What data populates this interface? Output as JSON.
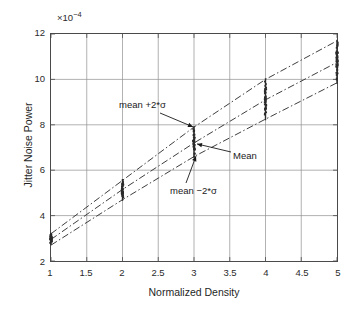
{
  "chart_data": {
    "type": "scatter",
    "title": "",
    "subtitle": "",
    "xlabel": "Normalized Density",
    "ylabel": "Jitter Noise Power",
    "y_exponent_prefix": "×10",
    "y_exponent_power": "−4",
    "y_exponent_full": "×10⁻⁴",
    "xlim": [
      1,
      5
    ],
    "ylim": [
      2,
      12
    ],
    "xticks": [
      "1",
      "1.5",
      "2",
      "2.5",
      "3",
      "3.5",
      "4",
      "4.5",
      "5"
    ],
    "xtick_values": [
      1,
      1.5,
      2,
      2.5,
      3,
      3.5,
      4,
      4.5,
      5
    ],
    "yticks": [
      "2",
      "4",
      "6",
      "8",
      "10",
      "12"
    ],
    "ytick_values": [
      2,
      4,
      6,
      8,
      10,
      12
    ],
    "grid": true,
    "legend": "none",
    "line_style": "dash-dot",
    "series": [
      {
        "name": "mean +2*σ",
        "style": "dash-dot",
        "color": "#3c3c3c",
        "x": [
          1,
          2,
          3,
          4,
          5
        ],
        "values": [
          3.2,
          5.55,
          7.9,
          10.0,
          11.7
        ]
      },
      {
        "name": "Mean",
        "style": "dash-dot",
        "color": "#3c3c3c",
        "x": [
          1,
          2,
          3,
          4,
          5
        ],
        "values": [
          2.95,
          5.15,
          7.2,
          9.1,
          10.75
        ]
      },
      {
        "name": "mean −2*σ",
        "style": "dash-dot",
        "color": "#3c3c3c",
        "x": [
          1,
          2,
          3,
          4,
          5
        ],
        "values": [
          2.7,
          4.7,
          6.6,
          8.25,
          9.85
        ]
      }
    ],
    "scatter_clusters": [
      {
        "x": 1,
        "y_min": 2.7,
        "y_max": 3.25,
        "count": 40
      },
      {
        "x": 2,
        "y_min": 4.65,
        "y_max": 5.6,
        "count": 40
      },
      {
        "x": 3,
        "y_min": 6.55,
        "y_max": 7.95,
        "count": 40
      },
      {
        "x": 4,
        "y_min": 8.2,
        "y_max": 10.05,
        "count": 40
      },
      {
        "x": 5,
        "y_min": 9.8,
        "y_max": 11.75,
        "count": 40
      }
    ],
    "annotations": [
      {
        "id": "upper",
        "text": "mean +2*σ",
        "points_to_x": 3,
        "points_to_y": 7.9
      },
      {
        "id": "mean",
        "text": "Mean",
        "points_to_x": 3,
        "points_to_y": 7.2
      },
      {
        "id": "lower",
        "text": "mean −2*σ",
        "points_to_x": 3,
        "points_to_y": 6.6
      }
    ],
    "colors": {
      "axis": "#4a4a4a",
      "grid": "#8f8f8f",
      "data": "#2b2b2b",
      "text": "#1a1a1a",
      "background": "#ffffff"
    }
  }
}
